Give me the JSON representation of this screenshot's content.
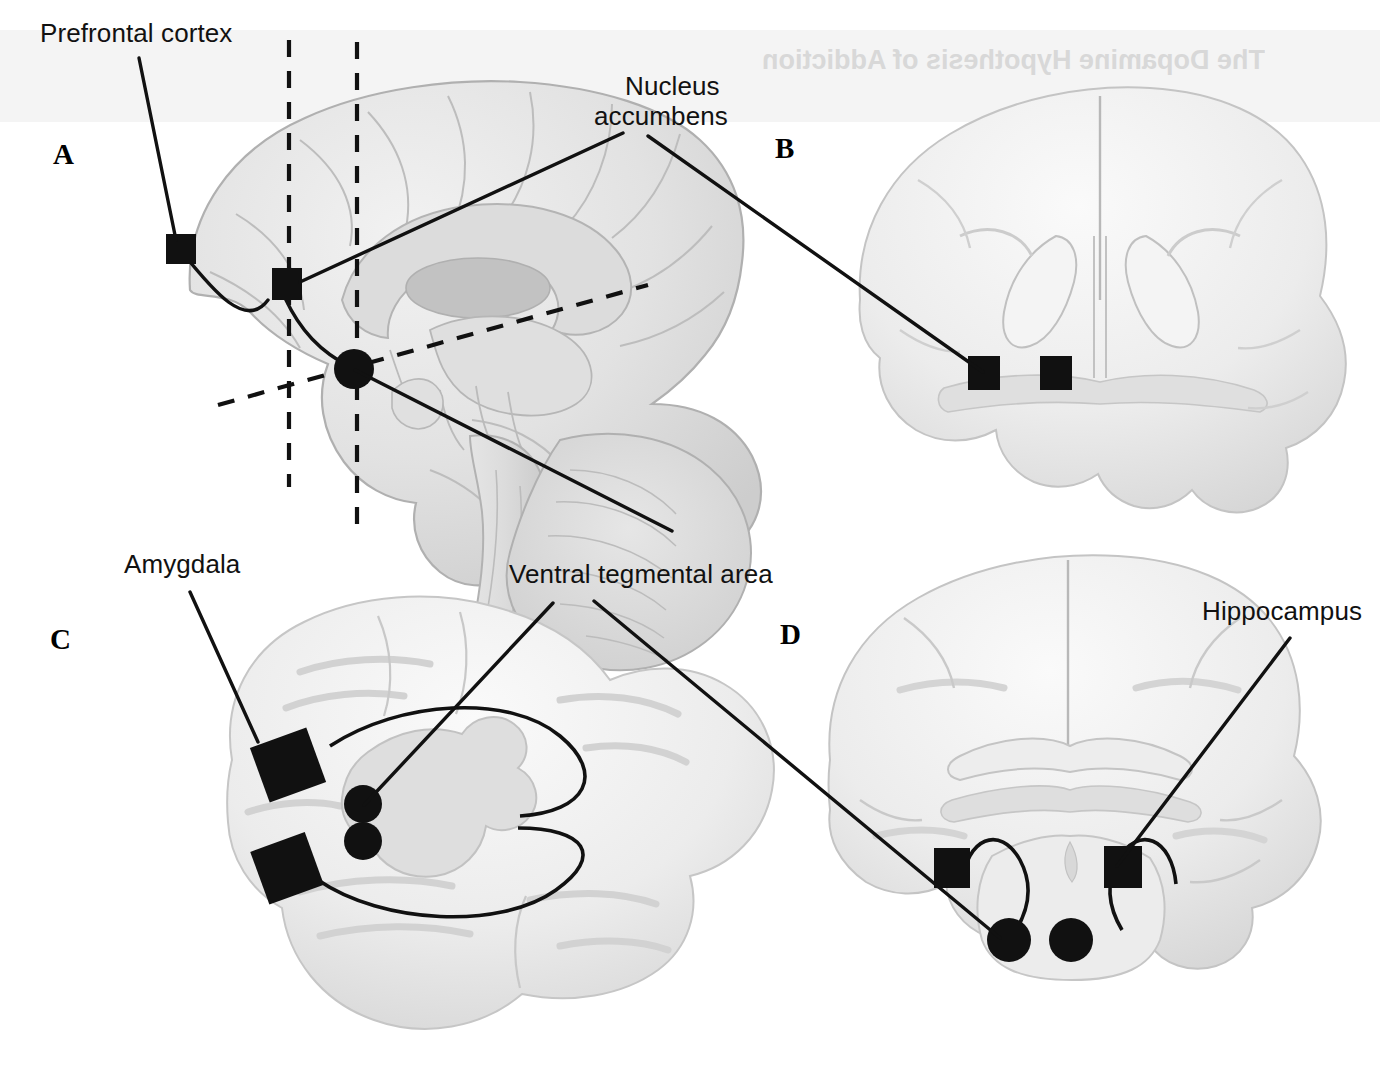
{
  "figure": {
    "background_color": "#ffffff",
    "marker_color": "#111111",
    "brain_fill": "#e4e4e4",
    "brain_stroke": "#b4b4b4"
  },
  "panels": [
    {
      "id": "A",
      "letter": "A",
      "view": "midsagittal section"
    },
    {
      "id": "B",
      "letter": "B",
      "view": "coronal section anterior"
    },
    {
      "id": "C",
      "letter": "C",
      "view": "oblique horizontal section"
    },
    {
      "id": "D",
      "letter": "D",
      "view": "coronal section posterior"
    }
  ],
  "labels": {
    "prefrontal_cortex": "Prefrontal cortex",
    "nucleus_accumbens_line1": "Nucleus",
    "nucleus_accumbens_line2": "accumbens",
    "amygdala": "Amygdala",
    "ventral_tegmental_area": "Ventral tegmental area",
    "hippocampus": "Hippocampus"
  },
  "ghost_text": {
    "title": "The Dopamine Hypothesis of Addiction",
    "note": "mirrored bleed-through from reverse of page"
  },
  "markers": {
    "square_regions": [
      "prefrontal cortex",
      "nucleus accumbens",
      "amygdala",
      "hippocampus"
    ],
    "circle_regions": [
      "ventral tegmental area"
    ]
  }
}
